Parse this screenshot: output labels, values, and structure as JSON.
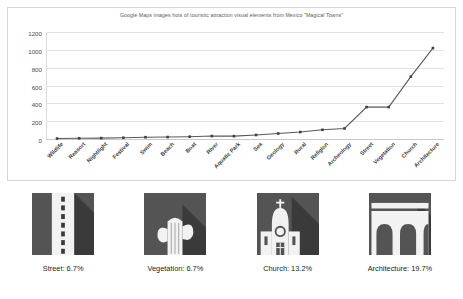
{
  "chart_data": {
    "type": "line",
    "title": "Google Maps images hots of touristic attraction visual elements from Mexico \"Magical Towns\"",
    "xlabel": "",
    "ylabel": "",
    "ylim": [
      0,
      1200
    ],
    "yticks": [
      0,
      200,
      400,
      600,
      800,
      1000,
      1200
    ],
    "grid": true,
    "legend": "none",
    "categories": [
      "Wildlife",
      "Reasort",
      "Nightlight",
      "Festival",
      "Swim",
      "Beach",
      "Boat",
      "River",
      "Aquatic Park",
      "Sea",
      "Geology",
      "Rural",
      "Religion",
      "Archeology",
      "Street",
      "Vegetation",
      "Church",
      "Architecture"
    ],
    "values": [
      5,
      8,
      10,
      14,
      20,
      22,
      26,
      33,
      32,
      45,
      62,
      78,
      103,
      118,
      358,
      358,
      700,
      1020
    ],
    "series": [
      {
        "name": "image hits",
        "values": [
          5,
          8,
          10,
          14,
          20,
          22,
          26,
          33,
          32,
          45,
          62,
          78,
          103,
          118,
          358,
          358,
          700,
          1020
        ]
      }
    ],
    "line_color": "#595959",
    "marker_color": "#404040"
  },
  "thumbnails": [
    {
      "icon": "street-road-icon",
      "caption": "Street: 6.7%",
      "label": "Street",
      "percent": "6.7%",
      "bg": "#545454",
      "fg": "#f2f2f2"
    },
    {
      "icon": "cactus-vegetation-icon",
      "caption": "Vegetation: 6.7%",
      "label": "Vegetation",
      "percent": "6.7%",
      "bg": "#545454",
      "fg": "#f2f2f2"
    },
    {
      "icon": "church-icon",
      "caption": "Church: 13.2%",
      "label": "Church",
      "percent": "13.2%",
      "bg": "#545454",
      "fg": "#f2f2f2"
    },
    {
      "icon": "aqueduct-architecture-icon",
      "caption": "Architecture: 19.7%",
      "label": "Architecture",
      "percent": "19.7%",
      "bg": "#545454",
      "fg": "#f2f2f2"
    }
  ]
}
